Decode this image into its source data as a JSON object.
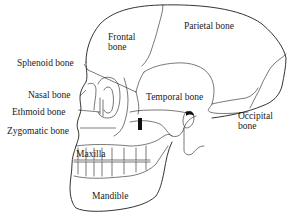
{
  "diagram": {
    "background": "#ffffff",
    "line_color": "#1e1e1e",
    "labels": {
      "frontal": {
        "line1": "Frontal",
        "line2": "bone"
      },
      "parietal": "Parietal bone",
      "sphenoid": "Sphenoid bone",
      "nasal": "Nasal bone",
      "temporal": "Temporal bone",
      "ethmoid": "Ethmoid bone",
      "occipital": {
        "line1": "Occipital",
        "line2": "bone"
      },
      "zygomatic": "Zygomatic bone",
      "maxilla": "Maxilla",
      "mandible": "Mandible"
    }
  }
}
